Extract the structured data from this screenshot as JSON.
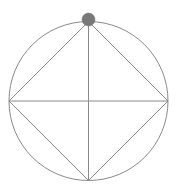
{
  "figure": {
    "background_color": "#ffffff",
    "width": 178,
    "height": 193,
    "stroke_color": "#8a8a8a",
    "stroke_width": 1,
    "marker_fill_color": "#787878",
    "marker_stroke_color": "#6e6e6e"
  },
  "geometry": {
    "circle": {
      "name": "circumscribed-circle",
      "center_x": 88.5,
      "center_y": 101,
      "radius": 79.5
    },
    "vertices": [
      {
        "name": "top-vertex",
        "x": 88.5,
        "y": 21.5,
        "label": "top"
      },
      {
        "name": "right-vertex",
        "x": 168,
        "y": 101,
        "label": "right"
      },
      {
        "name": "bottom-vertex",
        "x": 88.5,
        "y": 180.5,
        "label": "bottom"
      },
      {
        "name": "left-vertex",
        "x": 9,
        "y": 101,
        "label": "left"
      }
    ],
    "square": {
      "name": "inscribed-square",
      "points": "88.5,21.5 168,101 88.5,180.5 9,101"
    },
    "diameters": [
      {
        "name": "horizontal-diameter",
        "x1": 9,
        "y1": 101,
        "x2": 168,
        "y2": 101
      },
      {
        "name": "vertical-diameter",
        "x1": 88.5,
        "y1": 21.5,
        "x2": 88.5,
        "y2": 180.5
      }
    ],
    "marker": {
      "name": "top-vertex-marker",
      "cx": 88.5,
      "cy": 19.5,
      "r": 6.5
    }
  }
}
